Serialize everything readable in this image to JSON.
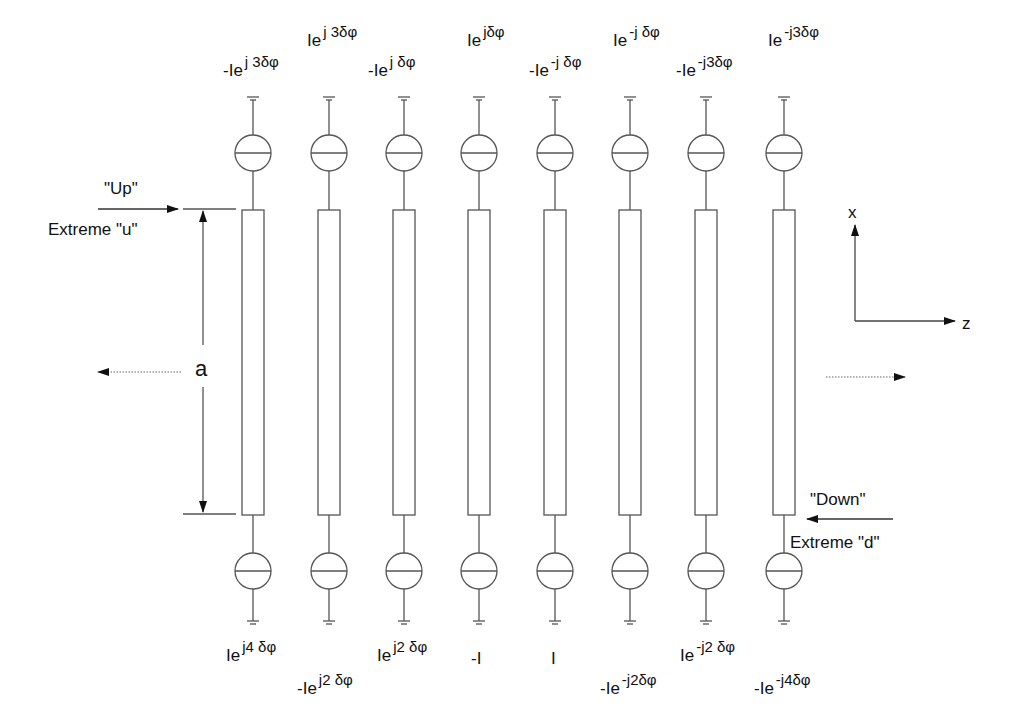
{
  "diagram": {
    "colors": {
      "line": "#555555",
      "text": "#111111",
      "background": "#ffffff"
    },
    "columns": [
      {
        "x": 253,
        "top_label": {
          "base": "-Ie",
          "exp": "j 3δφ"
        },
        "bottom_label": {
          "base": "Ie",
          "exp": "j4 δφ"
        }
      },
      {
        "x": 329,
        "top_label": {
          "base": "Ie",
          "exp": "j 3δφ"
        },
        "bottom_label": {
          "base": "-Ie",
          "exp": "j2 δφ"
        }
      },
      {
        "x": 404,
        "top_label": {
          "base": "-Ie",
          "exp": "j δφ"
        },
        "bottom_label": {
          "base": "Ie",
          "exp": "j2 δφ"
        }
      },
      {
        "x": 479,
        "top_label": {
          "base": "Ie",
          "exp": "jδφ"
        },
        "bottom_label": {
          "base": "-I",
          "exp": ""
        }
      },
      {
        "x": 555,
        "top_label": {
          "base": "-Ie",
          "exp": "-j δφ"
        },
        "bottom_label": {
          "base": "I",
          "exp": ""
        }
      },
      {
        "x": 630,
        "top_label": {
          "base": "Ie",
          "exp": "-j δφ"
        },
        "bottom_label": {
          "base": "-Ie",
          "exp": "-j2δφ"
        }
      },
      {
        "x": 706,
        "top_label": {
          "base": "-Ie",
          "exp": "-j3δφ"
        },
        "bottom_label": {
          "base": "Ie",
          "exp": "-j2 δφ"
        }
      },
      {
        "x": 784,
        "top_label": {
          "base": "Ie",
          "exp": "-j3δφ"
        },
        "bottom_label": {
          "base": "-Ie",
          "exp": "-j4δφ"
        }
      }
    ],
    "annotations": {
      "up": "\"Up\"",
      "extreme_u": "Extreme \"u\"",
      "down": "\"Down\"",
      "extreme_d": "Extreme \"d\"",
      "dimension": "a",
      "axis_x": "x",
      "axis_z": "z"
    }
  }
}
